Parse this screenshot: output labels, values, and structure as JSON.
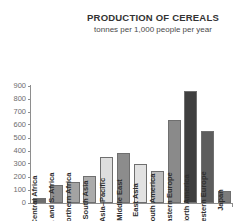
{
  "chart_data": {
    "type": "bar",
    "title": "PRODUCTION OF CEREALS",
    "subtitle": "tonnes per 1,000 people per year",
    "xlabel": "",
    "ylabel": "",
    "ylim": [
      0,
      900
    ],
    "yticks": [
      900,
      800,
      700,
      600,
      500,
      400,
      300,
      200,
      100,
      0
    ],
    "grid": false,
    "legend": "none",
    "categories": [
      "Central Africa",
      "E. and S. Africa",
      "Northern Africa",
      "South Asia",
      "Asia–Pacific",
      "Middle East",
      "East Asia",
      "South America",
      "Eastern Europe",
      "North America",
      "Western Europe",
      "Japan"
    ],
    "values": [
      40,
      140,
      165,
      205,
      355,
      385,
      300,
      250,
      635,
      860,
      555,
      95
    ],
    "bar_colors": [
      "#6e6e6e",
      "#8f8f8f",
      "#a3a3a3",
      "#ababab",
      "#dedede",
      "#8c8c8c",
      "#e2e2e2",
      "#bdbdbd",
      "#8a8a8a",
      "#3f3f3f",
      "#5d5d5d",
      "#7b7b7b"
    ]
  },
  "axis": {
    "tick_color": "#8e8e8e",
    "label_color": "#6d6d6d"
  },
  "colors": {
    "background": "#ffffff",
    "title": "#333333",
    "subtitle": "#4a4a4a",
    "bar_outline": "#6f6f6f"
  }
}
